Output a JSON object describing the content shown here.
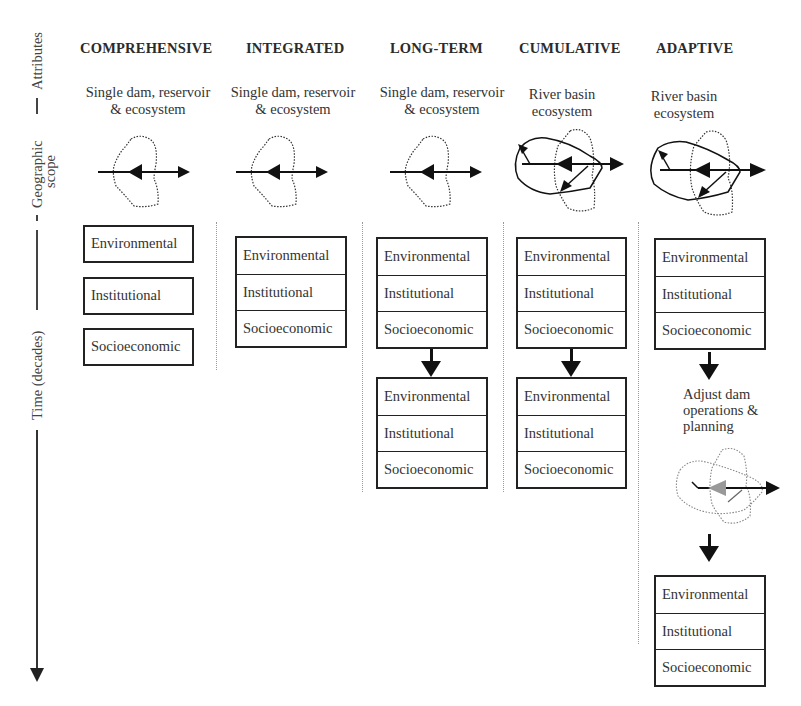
{
  "axis": {
    "attributes_label": "Attributes",
    "scope_label_line1": "Geographic",
    "scope_label_line2": "scope",
    "time_label": "Time (decades)"
  },
  "columns": [
    {
      "title": "COMPREHENSIVE",
      "scope_line1": "Single dam, reservoir",
      "scope_line2": "& ecosystem",
      "scope_icon": "single-dam-icon",
      "layout": "separate-boxes",
      "stages": [
        [
          "Environmental",
          "Institutional",
          "Socioeconomic"
        ]
      ]
    },
    {
      "title": "INTEGRATED",
      "scope_line1": "Single dam, reservoir",
      "scope_line2": "& ecosystem",
      "scope_icon": "single-dam-icon",
      "layout": "stacked-box",
      "stages": [
        [
          "Environmental",
          "Institutional",
          "Socioeconomic"
        ]
      ]
    },
    {
      "title": "LONG-TERM",
      "scope_line1": "Single dam, reservoir",
      "scope_line2": "& ecosystem",
      "scope_icon": "single-dam-icon",
      "layout": "stacked-box",
      "stages": [
        [
          "Environmental",
          "Institutional",
          "Socioeconomic"
        ],
        [
          "Environmental",
          "Institutional",
          "Socioeconomic"
        ]
      ]
    },
    {
      "title": "CUMULATIVE",
      "scope_line1": "River basin",
      "scope_line2": "ecosystem",
      "scope_icon": "river-basin-icon",
      "layout": "stacked-box",
      "stages": [
        [
          "Environmental",
          "Institutional",
          "Socioeconomic"
        ],
        [
          "Environmental",
          "Institutional",
          "Socioeconomic"
        ]
      ]
    },
    {
      "title": "ADAPTIVE",
      "scope_line1": "River basin",
      "scope_line2": "ecosystem",
      "scope_icon": "river-basin-icon",
      "layout": "stacked-box",
      "adjust_step": {
        "line1": "Adjust dam",
        "line2": "operations &",
        "line3": "planning",
        "icon": "adjusted-basin-icon"
      },
      "stages": [
        [
          "Environmental",
          "Institutional",
          "Socioeconomic"
        ],
        [
          "Environmental",
          "Institutional",
          "Socioeconomic"
        ]
      ]
    }
  ],
  "colors": {
    "ink": "#222222",
    "dotted": "#9a9a9a",
    "gray_arrow": "#9a9a9a"
  }
}
